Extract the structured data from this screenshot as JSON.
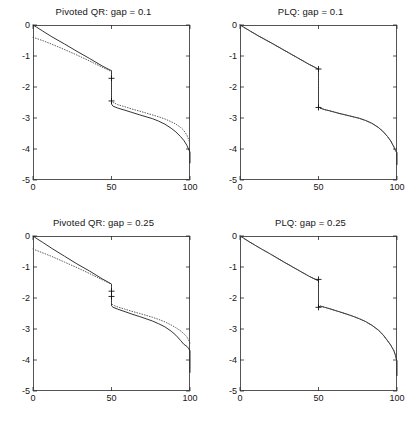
{
  "figure": {
    "background_color": "#ffffff",
    "layout": "2x2 subplot grid"
  },
  "chart_data": [
    {
      "type": "line",
      "panel_id": "pivoted-qr-gap-0.1",
      "title": "Pivoted QR: gap = 0.1",
      "xlabel": "",
      "ylabel": "",
      "xlim": [
        0,
        100
      ],
      "ylim": [
        -5,
        0
      ],
      "xticks": [
        0,
        50,
        100
      ],
      "xtick_labels": [
        "0",
        "50",
        "100"
      ],
      "yticks": [
        0,
        -1,
        -2,
        -3,
        -4,
        -5
      ],
      "ytick_labels": [
        "0",
        "-1",
        "-2",
        "-3",
        "-4",
        "-5"
      ],
      "grid": false,
      "legend": "none",
      "series": [
        {
          "name": "solid",
          "style": "solid",
          "color": "#1c1c1c",
          "x": [
            0,
            2,
            6,
            12,
            20,
            28,
            36,
            44,
            49,
            50,
            50,
            51,
            54,
            58,
            63,
            68,
            72,
            76,
            80,
            84,
            88,
            91,
            94,
            96,
            98,
            99,
            100,
            100
          ],
          "y": [
            0.0,
            -0.06,
            -0.19,
            -0.38,
            -0.61,
            -0.85,
            -1.08,
            -1.32,
            -1.45,
            -1.47,
            -2.55,
            -2.62,
            -2.68,
            -2.74,
            -2.82,
            -2.9,
            -2.96,
            -3.02,
            -3.1,
            -3.2,
            -3.33,
            -3.45,
            -3.6,
            -3.72,
            -3.88,
            -4.0,
            -4.1,
            -4.45
          ]
        },
        {
          "name": "dotted",
          "style": "dotted",
          "color": "#4a4a4a",
          "x": [
            0,
            2,
            6,
            12,
            20,
            28,
            36,
            44,
            49,
            50,
            50,
            51,
            54,
            58,
            63,
            68,
            72,
            76,
            80,
            84,
            88,
            91,
            94,
            96,
            98,
            99,
            100
          ],
          "y": [
            -0.4,
            -0.43,
            -0.5,
            -0.62,
            -0.79,
            -0.97,
            -1.16,
            -1.36,
            -1.48,
            -1.5,
            -2.45,
            -2.5,
            -2.57,
            -2.63,
            -2.71,
            -2.78,
            -2.84,
            -2.9,
            -2.96,
            -3.03,
            -3.12,
            -3.2,
            -3.3,
            -3.4,
            -3.55,
            -3.68,
            -3.8
          ]
        }
      ],
      "markers": [
        {
          "symbol": "+",
          "x": 50,
          "y": -1.72
        },
        {
          "symbol": "+",
          "x": 50,
          "y": -2.45
        }
      ]
    },
    {
      "type": "line",
      "panel_id": "plq-gap-0.1",
      "title": "PLQ: gap = 0.1",
      "xlabel": "",
      "ylabel": "",
      "xlim": [
        0,
        100
      ],
      "ylim": [
        -5,
        0
      ],
      "xticks": [
        0,
        50,
        100
      ],
      "xtick_labels": [
        "0",
        "50",
        "100"
      ],
      "yticks": [
        0,
        -1,
        -2,
        -3,
        -4,
        -5
      ],
      "ytick_labels": [
        "0",
        "-1",
        "-2",
        "-3",
        "-4",
        "-5"
      ],
      "grid": false,
      "legend": "none",
      "series": [
        {
          "name": "solid",
          "style": "solid",
          "color": "#1c1c1c",
          "x": [
            0,
            2,
            6,
            12,
            20,
            28,
            36,
            44,
            49,
            50,
            50,
            51,
            54,
            58,
            63,
            68,
            72,
            76,
            80,
            84,
            88,
            91,
            94,
            96,
            98,
            99,
            100,
            100
          ],
          "y": [
            0.0,
            -0.06,
            -0.18,
            -0.36,
            -0.58,
            -0.81,
            -1.04,
            -1.27,
            -1.4,
            -1.42,
            -2.63,
            -2.68,
            -2.73,
            -2.78,
            -2.85,
            -2.91,
            -2.96,
            -3.01,
            -3.08,
            -3.17,
            -3.3,
            -3.43,
            -3.6,
            -3.74,
            -3.93,
            -4.05,
            -4.12,
            -4.5
          ]
        },
        {
          "name": "dotted",
          "style": "dotted",
          "color": "#4a4a4a",
          "x": [
            0,
            2,
            6,
            12,
            20,
            28,
            36,
            44,
            49,
            50,
            50,
            51,
            54,
            58,
            63,
            68,
            72,
            76,
            80,
            84,
            88,
            91,
            94,
            96,
            98,
            99,
            100
          ],
          "y": [
            0.0,
            -0.06,
            -0.18,
            -0.36,
            -0.58,
            -0.81,
            -1.04,
            -1.27,
            -1.4,
            -1.42,
            -2.63,
            -2.68,
            -2.73,
            -2.78,
            -2.85,
            -2.91,
            -2.96,
            -3.01,
            -3.08,
            -3.17,
            -3.3,
            -3.43,
            -3.6,
            -3.74,
            -3.93,
            -4.05,
            -4.12
          ]
        }
      ],
      "markers": [
        {
          "symbol": "+",
          "x": 50,
          "y": -1.42
        },
        {
          "symbol": "+",
          "x": 50,
          "y": -2.66
        }
      ]
    },
    {
      "type": "line",
      "panel_id": "pivoted-qr-gap-0.25",
      "title": "Pivoted QR: gap = 0.25",
      "xlabel": "",
      "ylabel": "",
      "xlim": [
        0,
        100
      ],
      "ylim": [
        -5,
        0
      ],
      "xticks": [
        0,
        50,
        100
      ],
      "xtick_labels": [
        "0",
        "50",
        "100"
      ],
      "yticks": [
        0,
        -1,
        -2,
        -3,
        -4,
        -5
      ],
      "ytick_labels": [
        "0",
        "-1",
        "-2",
        "-3",
        "-4",
        "-5"
      ],
      "grid": false,
      "legend": "none",
      "series": [
        {
          "name": "solid",
          "style": "solid",
          "color": "#1c1c1c",
          "x": [
            0,
            2,
            6,
            12,
            20,
            28,
            36,
            44,
            49,
            50,
            50,
            51,
            54,
            58,
            63,
            68,
            72,
            76,
            80,
            84,
            88,
            91,
            94,
            96,
            98,
            99,
            100,
            100
          ],
          "y": [
            0.0,
            -0.07,
            -0.2,
            -0.4,
            -0.65,
            -0.9,
            -1.13,
            -1.38,
            -1.52,
            -1.55,
            -2.25,
            -2.3,
            -2.36,
            -2.43,
            -2.52,
            -2.6,
            -2.67,
            -2.74,
            -2.83,
            -2.93,
            -3.07,
            -3.2,
            -3.37,
            -3.49,
            -3.56,
            -3.62,
            -3.7,
            -4.4
          ]
        },
        {
          "name": "dotted",
          "style": "dotted",
          "color": "#4a4a4a",
          "x": [
            0,
            2,
            6,
            12,
            20,
            28,
            36,
            44,
            49,
            50,
            50,
            51,
            54,
            58,
            63,
            68,
            72,
            76,
            80,
            84,
            88,
            91,
            94,
            96,
            98,
            99,
            100
          ],
          "y": [
            -0.42,
            -0.46,
            -0.54,
            -0.66,
            -0.84,
            -1.02,
            -1.21,
            -1.41,
            -1.53,
            -1.56,
            -2.18,
            -2.23,
            -2.29,
            -2.35,
            -2.43,
            -2.5,
            -2.56,
            -2.62,
            -2.69,
            -2.77,
            -2.87,
            -2.96,
            -3.06,
            -3.15,
            -3.25,
            -3.35,
            -3.45
          ]
        }
      ],
      "markers": [
        {
          "symbol": "+",
          "x": 50,
          "y": -1.78
        },
        {
          "symbol": "+",
          "x": 50,
          "y": -1.95
        }
      ]
    },
    {
      "type": "line",
      "panel_id": "plq-gap-0.25",
      "title": "PLQ: gap = 0.25",
      "xlabel": "",
      "ylabel": "",
      "xlim": [
        0,
        100
      ],
      "ylim": [
        -5,
        0
      ],
      "xticks": [
        0,
        50,
        100
      ],
      "xtick_labels": [
        "0",
        "50",
        "100"
      ],
      "yticks": [
        0,
        -1,
        -2,
        -3,
        -4,
        -5
      ],
      "ytick_labels": [
        "0",
        "-1",
        "-2",
        "-3",
        "-4",
        "-5"
      ],
      "grid": false,
      "legend": "none",
      "series": [
        {
          "name": "solid",
          "style": "solid",
          "color": "#1c1c1c",
          "x": [
            0,
            2,
            6,
            12,
            20,
            28,
            36,
            44,
            49,
            50,
            50,
            51,
            54,
            58,
            63,
            68,
            72,
            76,
            80,
            84,
            88,
            91,
            94,
            96,
            98,
            99,
            100,
            100
          ],
          "y": [
            0.0,
            -0.06,
            -0.19,
            -0.37,
            -0.6,
            -0.84,
            -1.07,
            -1.3,
            -1.42,
            -1.44,
            -2.3,
            -2.26,
            -2.3,
            -2.36,
            -2.44,
            -2.52,
            -2.59,
            -2.67,
            -2.76,
            -2.88,
            -3.03,
            -3.18,
            -3.38,
            -3.52,
            -3.7,
            -3.85,
            -4.05,
            -4.5
          ]
        },
        {
          "name": "dotted",
          "style": "dotted",
          "color": "#4a4a4a",
          "x": [
            0,
            2,
            6,
            12,
            20,
            28,
            36,
            44,
            49,
            50,
            50,
            51,
            54,
            58,
            63,
            68,
            72,
            76,
            80,
            84,
            88,
            91,
            94,
            96,
            98,
            99,
            100
          ],
          "y": [
            0.0,
            -0.06,
            -0.19,
            -0.37,
            -0.6,
            -0.84,
            -1.07,
            -1.3,
            -1.42,
            -1.44,
            -2.3,
            -2.26,
            -2.3,
            -2.36,
            -2.44,
            -2.52,
            -2.59,
            -2.67,
            -2.76,
            -2.88,
            -3.03,
            -3.18,
            -3.38,
            -3.52,
            -3.7,
            -3.85,
            -4.05
          ]
        }
      ],
      "markers": [
        {
          "symbol": "+",
          "x": 50,
          "y": -1.4
        },
        {
          "symbol": "+",
          "x": 50,
          "y": -2.3
        }
      ]
    }
  ]
}
